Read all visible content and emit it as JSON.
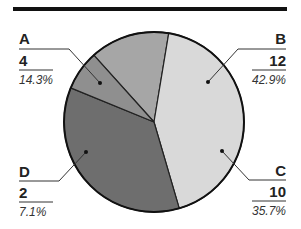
{
  "chart_data": {
    "type": "pie",
    "title": "",
    "categories": [
      "A",
      "B",
      "C",
      "D"
    ],
    "values": [
      4,
      12,
      10,
      2
    ],
    "percentages": [
      "14.3%",
      "42.9%",
      "35.7%",
      "7.1%"
    ],
    "colors": [
      "#a6a6a6",
      "#d9d9d9",
      "#6e6e6e",
      "#8f8f8f"
    ],
    "legend": "none (callout labels)"
  },
  "labels": {
    "A": {
      "name": "A",
      "value": "4",
      "pct": "14.3%"
    },
    "B": {
      "name": "B",
      "value": "12",
      "pct": "42.9%"
    },
    "C": {
      "name": "C",
      "value": "10",
      "pct": "35.7%"
    },
    "D": {
      "name": "D",
      "value": "2",
      "pct": "7.1%"
    }
  }
}
